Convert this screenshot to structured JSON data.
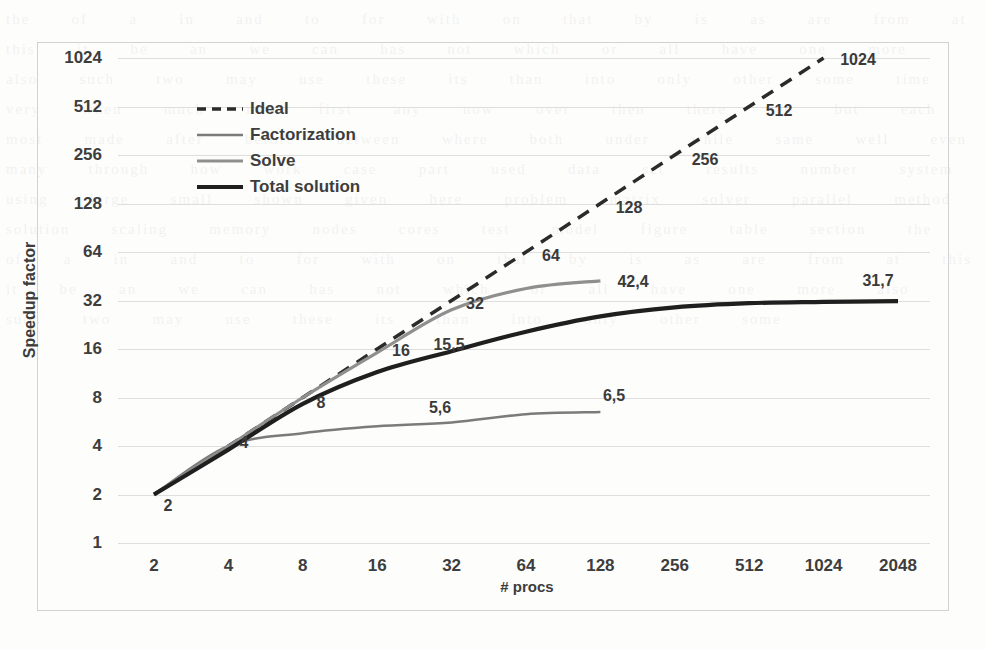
{
  "chart_data": {
    "type": "line",
    "title": "",
    "xlabel": "# procs",
    "ylabel": "Speedup factor",
    "xscale": "log2",
    "yscale": "log2",
    "xticks": [
      "2",
      "4",
      "8",
      "16",
      "32",
      "64",
      "128",
      "256",
      "512",
      "1024",
      "2048"
    ],
    "yticks": [
      "1",
      "2",
      "4",
      "8",
      "16",
      "32",
      "64",
      "128",
      "256",
      "512",
      "1024"
    ],
    "xlim": [
      2,
      2048
    ],
    "ylim": [
      1,
      1024
    ],
    "grid": true,
    "legend_position": "upper-left-inside",
    "series": [
      {
        "name": "Ideal",
        "style": "dashed",
        "color": "#2b2b2b",
        "width": 3.5,
        "x": [
          2,
          4,
          8,
          16,
          32,
          64,
          128,
          256,
          512,
          1024
        ],
        "values": [
          2,
          4,
          8,
          16,
          32,
          64,
          128,
          256,
          512,
          1024
        ],
        "point_labels": [
          "2",
          "4",
          "8",
          "16",
          "32",
          "64",
          "128",
          "256",
          "512",
          "1024"
        ]
      },
      {
        "name": "Factorization",
        "style": "solid",
        "color": "#7b7b7b",
        "width": 2.6,
        "x": [
          2,
          4,
          8,
          16,
          32,
          64,
          128
        ],
        "values": [
          2,
          4,
          4.8,
          5.3,
          5.6,
          6.3,
          6.5
        ],
        "point_labels": [
          "",
          "",
          "",
          "",
          "5,6",
          "",
          "6,5"
        ]
      },
      {
        "name": "Solve",
        "style": "solid",
        "color": "#8f8f8f",
        "width": 3.2,
        "x": [
          2,
          4,
          8,
          16,
          32,
          64,
          128
        ],
        "values": [
          2,
          4,
          8,
          15.2,
          28,
          38,
          42.4
        ],
        "point_labels": [
          "",
          "",
          "",
          "",
          "",
          "",
          "42,4"
        ]
      },
      {
        "name": "Total solution",
        "style": "solid",
        "color": "#1f1f1f",
        "width": 4.2,
        "x": [
          2,
          4,
          8,
          16,
          32,
          64,
          128,
          256,
          512,
          1024,
          2048
        ],
        "values": [
          2,
          3.8,
          7.3,
          11.5,
          15.5,
          20.5,
          25.5,
          29,
          30.8,
          31.4,
          31.7
        ],
        "point_labels": [
          "2",
          "",
          "8",
          "",
          "15,5",
          "",
          "",
          "",
          "",
          "",
          "31,7"
        ]
      }
    ],
    "data_labels": [
      {
        "text": "2",
        "x": 168,
        "y": 506
      },
      {
        "text": "4",
        "x": 244,
        "y": 443
      },
      {
        "text": "8",
        "x": 321,
        "y": 403
      },
      {
        "text": "16",
        "x": 401,
        "y": 351
      },
      {
        "text": "32",
        "x": 475,
        "y": 304
      },
      {
        "text": "64",
        "x": 551,
        "y": 256
      },
      {
        "text": "128",
        "x": 629,
        "y": 208
      },
      {
        "text": "256",
        "x": 705,
        "y": 160
      },
      {
        "text": "512",
        "x": 779,
        "y": 111
      },
      {
        "text": "1024",
        "x": 858,
        "y": 60
      },
      {
        "text": "15,5",
        "x": 449,
        "y": 345
      },
      {
        "text": "5,6",
        "x": 440,
        "y": 408
      },
      {
        "text": "6,5",
        "x": 614,
        "y": 396
      },
      {
        "text": "42,4",
        "x": 633,
        "y": 282
      },
      {
        "text": "31,7",
        "x": 878,
        "y": 281
      }
    ]
  },
  "legend": {
    "entries": [
      {
        "label": "Ideal"
      },
      {
        "label": "Factorization"
      },
      {
        "label": "Solve"
      },
      {
        "label": "Total solution"
      }
    ]
  },
  "scan": {
    "bleed_text": "the   of   a   in   and   to   for   with   on   that   by   is   as   are   from   at   this   it   be   an   we   can   has   not   which   or   all   have   one   more   also   such   two   may   use   these   its   than   into   only   other   some   time   very   when   much   new   first   any   now   over   then   there   see   but   each   most   made   after   before   between   where   both   under   while   same   well   even   many   through   how   work   case   part   used   data   set   results   number   system   using   large   small   shown   given   here   problem   matrix   solver   parallel   method   solution   scaling   memory   nodes   cores   test   model   figure   table   section   the   of   a   in   and   to   for   with   on   that   by   is   as   are   from   at   this   it   be   an   we   can   has   not   which   or   all   have   one   more   also   such   two   may   use   these   its   than   into   only   other   some"
  }
}
